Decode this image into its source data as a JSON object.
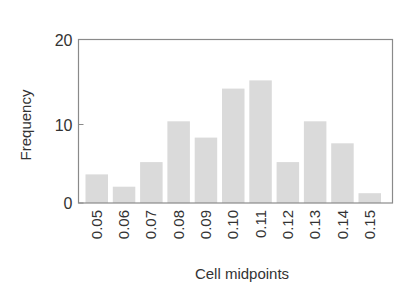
{
  "chart_data": {
    "type": "bar",
    "title": "",
    "xlabel": "Cell midpoints",
    "ylabel": "Frequency",
    "categories": [
      "0.05",
      "0.06",
      "0.07",
      "0.08",
      "0.09",
      "0.10",
      "0.11",
      "0.12",
      "0.13",
      "0.14",
      "0.15"
    ],
    "values": [
      3.5,
      2,
      5,
      10,
      8,
      14,
      15,
      5,
      10,
      7.3,
      1.2
    ],
    "ylim": [
      0,
      20
    ],
    "yticks": [
      0,
      10,
      20
    ],
    "xtick_rotation": -90,
    "grid": false,
    "legend": null,
    "bar_color": "#dadada",
    "frame_color": "#888888"
  }
}
